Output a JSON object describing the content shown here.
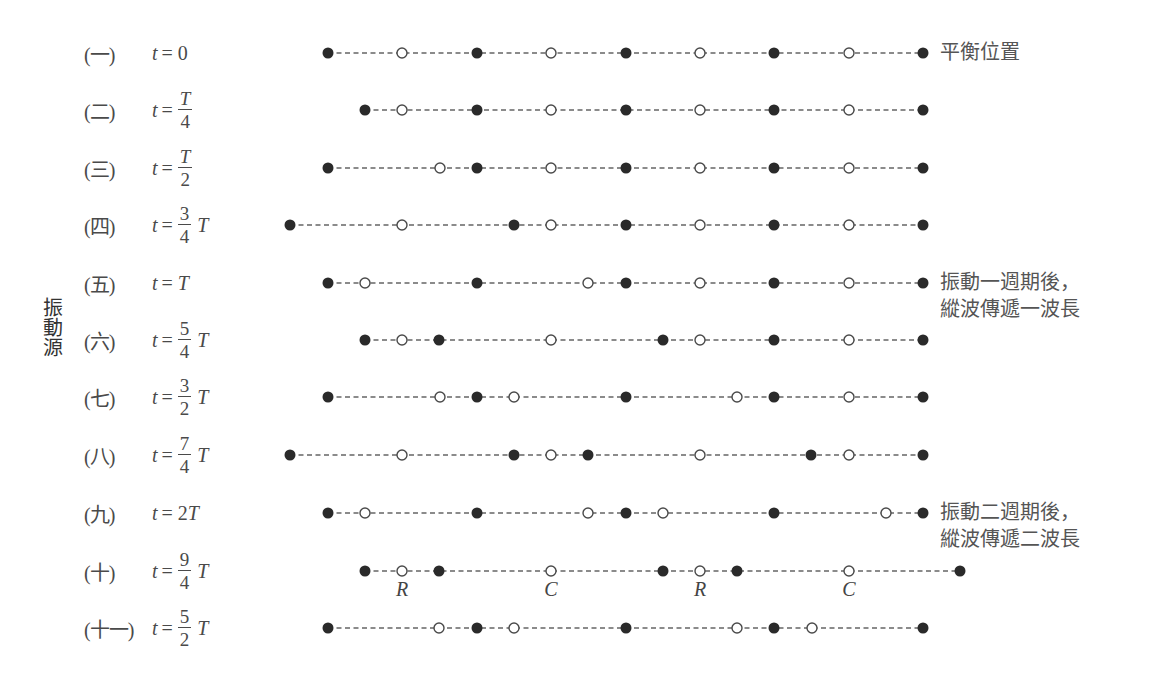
{
  "figure": {
    "source_label": "振動源",
    "equilibrium_spacing_px": 74.4,
    "colors": {
      "filled": "#2a2a2a",
      "open_stroke": "#4a4a4a",
      "dash": "#666666",
      "text": "#4a4a4a"
    },
    "notes": [
      {
        "id": "equilibrium",
        "lines": [
          "平衡位置"
        ],
        "x": 940,
        "y": 39
      },
      {
        "id": "one-period",
        "lines": [
          "振動一週期後，",
          "縱波傳遞一波長"
        ],
        "x": 940,
        "y": 269
      },
      {
        "id": "two-periods",
        "lines": [
          "振動二週期後，",
          "縱波傳遞二波長"
        ],
        "x": 940,
        "y": 499
      }
    ],
    "rc_labels": [
      {
        "text": "R",
        "x": 402,
        "y": 578
      },
      {
        "text": "C",
        "x": 551,
        "y": 578
      },
      {
        "text": "R",
        "x": 700,
        "y": 578
      },
      {
        "text": "C",
        "x": 849,
        "y": 578
      }
    ],
    "rows": [
      {
        "num": "(一)",
        "t": "t",
        "eq": "=",
        "value": "0",
        "frac": null,
        "tail": "",
        "y": 53,
        "particles": [
          [
            328,
            "f"
          ],
          [
            402,
            "o"
          ],
          [
            477,
            "f"
          ],
          [
            551,
            "o"
          ],
          [
            626,
            "f"
          ],
          [
            700,
            "o"
          ],
          [
            774,
            "f"
          ],
          [
            849,
            "o"
          ],
          [
            923,
            "f"
          ]
        ]
      },
      {
        "num": "(二)",
        "t": "t",
        "eq": "=",
        "value": "",
        "frac": {
          "top": "T",
          "bot": "4",
          "top_italic": true
        },
        "tail": "",
        "y": 110,
        "particles": [
          [
            365,
            "f"
          ],
          [
            402,
            "o"
          ],
          [
            477,
            "f"
          ],
          [
            551,
            "o"
          ],
          [
            626,
            "f"
          ],
          [
            700,
            "o"
          ],
          [
            774,
            "f"
          ],
          [
            849,
            "o"
          ],
          [
            923,
            "f"
          ]
        ]
      },
      {
        "num": "(三)",
        "t": "t",
        "eq": "=",
        "value": "",
        "frac": {
          "top": "T",
          "bot": "2",
          "top_italic": true
        },
        "tail": "",
        "y": 168,
        "particles": [
          [
            328,
            "f"
          ],
          [
            440,
            "o"
          ],
          [
            477,
            "f"
          ],
          [
            551,
            "o"
          ],
          [
            626,
            "f"
          ],
          [
            700,
            "o"
          ],
          [
            774,
            "f"
          ],
          [
            849,
            "o"
          ],
          [
            923,
            "f"
          ]
        ]
      },
      {
        "num": "(四)",
        "t": "t",
        "eq": "=",
        "value": "",
        "frac": {
          "top": "3",
          "bot": "4",
          "top_italic": false
        },
        "tail": "T",
        "y": 225,
        "particles": [
          [
            290,
            "f"
          ],
          [
            402,
            "o"
          ],
          [
            514,
            "f"
          ],
          [
            551,
            "o"
          ],
          [
            626,
            "f"
          ],
          [
            700,
            "o"
          ],
          [
            774,
            "f"
          ],
          [
            849,
            "o"
          ],
          [
            923,
            "f"
          ]
        ]
      },
      {
        "num": "(五)",
        "t": "t",
        "eq": "=",
        "value": "",
        "frac": null,
        "tail": "T",
        "y": 283,
        "particles": [
          [
            328,
            "f"
          ],
          [
            365,
            "o"
          ],
          [
            477,
            "f"
          ],
          [
            588,
            "o"
          ],
          [
            626,
            "f"
          ],
          [
            700,
            "o"
          ],
          [
            774,
            "f"
          ],
          [
            849,
            "o"
          ],
          [
            923,
            "f"
          ]
        ]
      },
      {
        "num": "(六)",
        "t": "t",
        "eq": "=",
        "value": "",
        "frac": {
          "top": "5",
          "bot": "4",
          "top_italic": false
        },
        "tail": "T",
        "y": 340,
        "particles": [
          [
            365,
            "f"
          ],
          [
            402,
            "o"
          ],
          [
            439,
            "f"
          ],
          [
            551,
            "o"
          ],
          [
            663,
            "f"
          ],
          [
            700,
            "o"
          ],
          [
            774,
            "f"
          ],
          [
            849,
            "o"
          ],
          [
            923,
            "f"
          ]
        ]
      },
      {
        "num": "(七)",
        "t": "t",
        "eq": "=",
        "value": "",
        "frac": {
          "top": "3",
          "bot": "2",
          "top_italic": false
        },
        "tail": "T",
        "y": 397,
        "particles": [
          [
            328,
            "f"
          ],
          [
            440,
            "o"
          ],
          [
            477,
            "f"
          ],
          [
            514,
            "o"
          ],
          [
            626,
            "f"
          ],
          [
            737,
            "o"
          ],
          [
            774,
            "f"
          ],
          [
            849,
            "o"
          ],
          [
            923,
            "f"
          ]
        ]
      },
      {
        "num": "(八)",
        "t": "t",
        "eq": "=",
        "value": "",
        "frac": {
          "top": "7",
          "bot": "4",
          "top_italic": false
        },
        "tail": "T",
        "y": 455,
        "particles": [
          [
            290,
            "f"
          ],
          [
            402,
            "o"
          ],
          [
            514,
            "f"
          ],
          [
            551,
            "o"
          ],
          [
            588,
            "f"
          ],
          [
            700,
            "o"
          ],
          [
            811,
            "f"
          ],
          [
            849,
            "o"
          ],
          [
            923,
            "f"
          ]
        ]
      },
      {
        "num": "(九)",
        "t": "t",
        "eq": "=",
        "value": "2T",
        "frac": null,
        "tail": "",
        "y": 513,
        "particles": [
          [
            328,
            "f"
          ],
          [
            365,
            "o"
          ],
          [
            477,
            "f"
          ],
          [
            588,
            "o"
          ],
          [
            626,
            "f"
          ],
          [
            663,
            "o"
          ],
          [
            774,
            "f"
          ],
          [
            886,
            "o"
          ],
          [
            923,
            "f"
          ]
        ]
      },
      {
        "num": "(十)",
        "t": "t",
        "eq": "=",
        "value": "",
        "frac": {
          "top": "9",
          "bot": "4",
          "top_italic": false
        },
        "tail": "T",
        "y": 571,
        "particles": [
          [
            365,
            "f"
          ],
          [
            402,
            "o"
          ],
          [
            439,
            "f"
          ],
          [
            551,
            "o"
          ],
          [
            663,
            "f"
          ],
          [
            700,
            "o"
          ],
          [
            737,
            "f"
          ],
          [
            849,
            "o"
          ],
          [
            960,
            "f"
          ]
        ]
      },
      {
        "num": "(十一)",
        "t": "t",
        "eq": "=",
        "value": "",
        "frac": {
          "top": "5",
          "bot": "2",
          "top_italic": false
        },
        "tail": "T",
        "y": 628,
        "particles": [
          [
            328,
            "f"
          ],
          [
            439,
            "o"
          ],
          [
            477,
            "f"
          ],
          [
            514,
            "o"
          ],
          [
            626,
            "f"
          ],
          [
            737,
            "o"
          ],
          [
            774,
            "f"
          ],
          [
            812,
            "o"
          ],
          [
            923,
            "f"
          ]
        ]
      }
    ]
  }
}
